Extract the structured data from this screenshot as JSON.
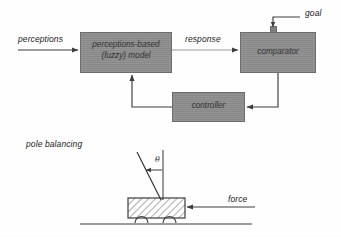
{
  "figure": {
    "blocks": [
      {
        "id": "model",
        "label_line1": "perceptions-based",
        "label_line2": "(fuzzy) model",
        "fill": "#8e8e8e"
      },
      {
        "id": "comparator",
        "label": "comparator",
        "fill": "#8e8e8e"
      },
      {
        "id": "controller",
        "label": "controller",
        "fill": "#8e8e8e"
      }
    ],
    "signals": {
      "perceptions": "perceptions",
      "response": "response",
      "goal": "goal"
    },
    "example": {
      "caption": "pole balancing",
      "angle_symbol": "θ",
      "force_label": "force"
    },
    "colors": {
      "block_fill": "#8e8e8e",
      "block_stroke": "#6d6d6d",
      "line": "#3d3d3d",
      "text": "#222222",
      "background": "#ffffff"
    }
  }
}
